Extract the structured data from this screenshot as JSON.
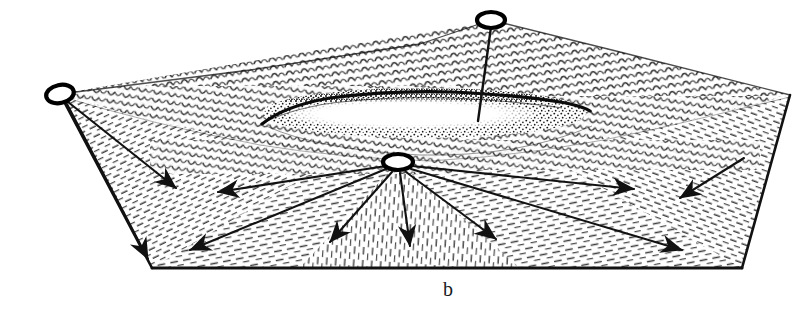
{
  "figure": {
    "label": "b",
    "watermark": "",
    "ink_color": "#111111",
    "background_color": "#ffffff",
    "stipple_color": "#1b1b1b",
    "hatch_color": "#444444"
  },
  "diagram": {
    "type": "line-art-block-diagram",
    "outline": {
      "name": "terrain-block-outline",
      "points": "60,94 491,20 790,95 742,268 152,268"
    },
    "ridge_crest": {
      "name": "ridge-crest-line",
      "points": "60,94 250,70 420,44 491,20 620,52 790,95"
    },
    "inner_rim": {
      "name": "inner-rim-line",
      "points": "60,96 140,118 250,142 340,156 430,160 540,152 650,130 740,108 790,97"
    },
    "crater": {
      "name": "crater-depression",
      "rim_path": "262,123 300,104 360,95 430,92 500,94 560,100 580,104",
      "cx": 424,
      "cy": 113,
      "rx": 162,
      "ry": 25,
      "floor_cx": 412,
      "floor_cy": 114,
      "floor_rx": 118,
      "floor_ry": 13
    },
    "nodes": [
      {
        "name": "vent-node-left",
        "cx": 60,
        "cy": 94,
        "rx": 14,
        "ry": 9,
        "rot": -12
      },
      {
        "name": "vent-node-top",
        "cx": 491,
        "cy": 20,
        "rx": 14,
        "ry": 8,
        "rot": 0
      },
      {
        "name": "vent-node-center",
        "cx": 398,
        "cy": 162,
        "rx": 15,
        "ry": 8,
        "rot": 0
      }
    ],
    "connectors": [
      {
        "name": "connector-top-node-to-crater-rim",
        "x1": 491,
        "y1": 26,
        "x2": 478,
        "y2": 120
      },
      {
        "name": "connector-left-node-to-edge",
        "x1": 62,
        "y1": 101,
        "x2": 152,
        "y2": 268
      }
    ],
    "arrows": [
      {
        "name": "arrow-left-node-se-short",
        "x1": 66,
        "y1": 100,
        "x2": 180,
        "y2": 192
      },
      {
        "name": "arrow-left-node-s-long",
        "x1": 66,
        "y1": 101,
        "x2": 152,
        "y2": 265
      },
      {
        "name": "arrow-center-to-west",
        "x1": 386,
        "y1": 166,
        "x2": 214,
        "y2": 193
      },
      {
        "name": "arrow-center-to-southwest",
        "x1": 386,
        "y1": 168,
        "x2": 186,
        "y2": 252
      },
      {
        "name": "arrow-center-to-south-sw",
        "x1": 392,
        "y1": 171,
        "x2": 326,
        "y2": 245
      },
      {
        "name": "arrow-center-to-south",
        "x1": 400,
        "y1": 172,
        "x2": 410,
        "y2": 250
      },
      {
        "name": "arrow-center-to-south-se",
        "x1": 406,
        "y1": 171,
        "x2": 500,
        "y2": 243
      },
      {
        "name": "arrow-center-to-east",
        "x1": 412,
        "y1": 166,
        "x2": 640,
        "y2": 190
      },
      {
        "name": "arrow-center-to-southeast-long",
        "x1": 410,
        "y1": 168,
        "x2": 688,
        "y2": 252
      },
      {
        "name": "arrow-northeast-inbound",
        "x1": 742,
        "y1": 160,
        "x2": 676,
        "y2": 200
      }
    ]
  }
}
